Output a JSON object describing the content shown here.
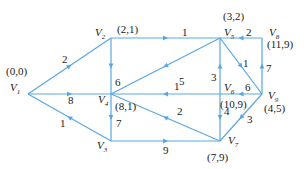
{
  "diagram": {
    "type": "directed-weighted-graph",
    "edge_color": "#5aa7e0",
    "text_color": "#1a1a1a",
    "nodes": [
      {
        "id": "V1",
        "name": "V",
        "sub": "1",
        "x": 28,
        "y": 94,
        "label": "(0,0)",
        "nx": 10,
        "ny": 91,
        "lx": 6,
        "ly": 75
      },
      {
        "id": "V2",
        "name": "V",
        "sub": "2",
        "x": 111,
        "y": 38,
        "label": "(2,1)",
        "nx": 95,
        "ny": 36,
        "lx": 117,
        "ly": 33
      },
      {
        "id": "V3",
        "name": "V",
        "sub": "3",
        "x": 111,
        "y": 141,
        "label": "",
        "nx": 97,
        "ny": 149,
        "lx": 0,
        "ly": 0
      },
      {
        "id": "V4",
        "name": "V",
        "sub": "4",
        "x": 111,
        "y": 94,
        "label": "(8,1)",
        "nx": 98,
        "ny": 103,
        "lx": 115,
        "ly": 110
      },
      {
        "id": "V5",
        "name": "V",
        "sub": "5",
        "x": 220,
        "y": 38,
        "label": "(3,2)",
        "nx": 224,
        "ny": 36,
        "lx": 223,
        "ly": 20
      },
      {
        "id": "V6",
        "name": "V",
        "sub": "6",
        "x": 220,
        "y": 94,
        "label": "(10,9)",
        "nx": 224,
        "ny": 91,
        "lx": 220,
        "ly": 108
      },
      {
        "id": "V7",
        "name": "V",
        "sub": "7",
        "x": 220,
        "y": 141,
        "label": "(7,9)",
        "nx": 228,
        "ny": 144,
        "lx": 207,
        "ly": 161
      },
      {
        "id": "V8",
        "name": "V",
        "sub": "8",
        "x": 262,
        "y": 38,
        "label": "(11,9)",
        "nx": 269,
        "ny": 36,
        "lx": 267,
        "ly": 48
      },
      {
        "id": "V9",
        "name": "V",
        "sub": "9",
        "x": 262,
        "y": 94,
        "label": "(4,5)",
        "nx": 268,
        "ny": 99,
        "lx": 264,
        "ly": 112
      }
    ],
    "edges": [
      {
        "from": "V1",
        "to": "V2",
        "weight": "2",
        "wx": 62,
        "wy": 63
      },
      {
        "from": "V1",
        "to": "V4",
        "weight": "8",
        "wx": 68,
        "wy": 104
      },
      {
        "from": "V3",
        "to": "V1",
        "weight": "1",
        "wx": 60,
        "wy": 127
      },
      {
        "from": "V2",
        "to": "V5",
        "weight": "1",
        "wx": 182,
        "wy": 36
      },
      {
        "from": "V2",
        "to": "V4",
        "weight": "6",
        "wx": 115,
        "wy": 86
      },
      {
        "from": "V5",
        "to": "V4",
        "weight": "5",
        "wx": 179,
        "wy": 85
      },
      {
        "from": "V6",
        "to": "V4",
        "weight": "1",
        "wx": 174,
        "wy": 90
      },
      {
        "from": "V7",
        "to": "V4",
        "weight": "2",
        "wx": 177,
        "wy": 115
      },
      {
        "from": "V4",
        "to": "V3",
        "weight": "7",
        "wx": 116,
        "wy": 127
      },
      {
        "from": "V3",
        "to": "V7",
        "weight": "9",
        "wx": 163,
        "wy": 154
      },
      {
        "from": "V6",
        "to": "V5",
        "weight": "3",
        "wx": 211,
        "wy": 81
      },
      {
        "from": "V6",
        "to": "V7",
        "weight": "4",
        "wx": 224,
        "wy": 115
      },
      {
        "from": "V5",
        "to": "V9",
        "weight": "1",
        "wx": 243,
        "wy": 67
      },
      {
        "from": "V8",
        "to": "V5",
        "weight": "2",
        "wx": 246,
        "wy": 36
      },
      {
        "from": "V9",
        "to": "V8",
        "weight": "7",
        "wx": 266,
        "wy": 72
      },
      {
        "from": "V9",
        "to": "V6",
        "weight": "6",
        "wx": 245,
        "wy": 91
      },
      {
        "from": "V9",
        "to": "V7",
        "weight": "3",
        "wx": 247,
        "wy": 123
      }
    ]
  }
}
